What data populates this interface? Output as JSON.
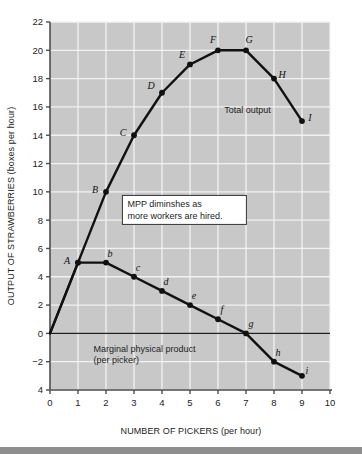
{
  "figure": {
    "background_color": "#ffffff",
    "plot_background_color": "#c8c8c8",
    "gridline_color": "#f2f2f2",
    "axis_color": "#4d4d4d",
    "curve_color": "#111111",
    "bottom_bar_color": "#8e8e8e"
  },
  "chart_data": {
    "type": "line",
    "title": "",
    "xlabel": "NUMBER OF PICKERS (per hour)",
    "ylabel": "OUTPUT OF STRAWBERRIES (boxes per hour)",
    "xlim": [
      0,
      10
    ],
    "ylim": [
      -4,
      22
    ],
    "xticks": [
      "0",
      "1",
      "2",
      "3",
      "4",
      "5",
      "6",
      "7",
      "8",
      "9",
      "10"
    ],
    "xtick_values": [
      0,
      1,
      2,
      3,
      4,
      5,
      6,
      7,
      8,
      9,
      10
    ],
    "yticks": [
      "22",
      "20",
      "18",
      "16",
      "14",
      "12",
      "10",
      "8",
      "6",
      "4",
      "2",
      "0",
      "−2",
      "4"
    ],
    "ytick_values": [
      22,
      20,
      18,
      16,
      14,
      12,
      10,
      8,
      6,
      4,
      2,
      0,
      -2,
      -4
    ],
    "grid": true,
    "legend_position": "inline-labels",
    "series": [
      {
        "name": "Total output",
        "label": "Total output",
        "label_x": 7.05,
        "label_y": 15.6,
        "point_label_case": "uppercase-italic",
        "x": [
          0,
          1,
          2,
          3,
          4,
          5,
          6,
          7,
          8,
          9
        ],
        "y": [
          0,
          5,
          10,
          14,
          17,
          19,
          20,
          20,
          18,
          15
        ],
        "point_labels": [
          "",
          "A",
          "B",
          "C",
          "D",
          "E",
          "F",
          "G",
          "H",
          "I"
        ],
        "label_offsets": [
          [
            0,
            0
          ],
          [
            -11,
            1
          ],
          [
            -11,
            1
          ],
          [
            -11,
            1
          ],
          [
            -11,
            -4
          ],
          [
            -8,
            -6
          ],
          [
            -5,
            -7
          ],
          [
            3,
            -7
          ],
          [
            8,
            -1
          ],
          [
            8,
            0
          ]
        ]
      },
      {
        "name": "Marginal physical product",
        "label": "Marginal physical product\n(per picker)",
        "label_line1": "Marginal physical product",
        "label_line2": "(per picker)",
        "label_x": 1.55,
        "label_y": -1.35,
        "point_label_case": "lowercase-italic",
        "x": [
          0,
          1,
          2,
          3,
          4,
          5,
          6,
          7,
          8,
          9
        ],
        "y": [
          0,
          5,
          5,
          4,
          3,
          2,
          1,
          0,
          -2,
          -3
        ],
        "point_labels": [
          "",
          "A",
          "b",
          "c",
          "d",
          "e",
          "f",
          "g",
          "h",
          "i"
        ],
        "label_offsets": [
          [
            0,
            0
          ],
          [
            -11,
            1
          ],
          [
            4,
            -6
          ],
          [
            4,
            -6
          ],
          [
            4,
            -6
          ],
          [
            4,
            -6
          ],
          [
            4,
            -6
          ],
          [
            5,
            -6
          ],
          [
            4,
            -6
          ],
          [
            5,
            -2
          ]
        ]
      }
    ],
    "annotations": [
      {
        "name": "mpp-annotation",
        "line1": "MPP diminshes as",
        "line2": "more workers are hired.",
        "x": 4.8,
        "y": 8.9,
        "boxed": true,
        "box_fill": "#ffffff",
        "box_border": "#333333"
      }
    ],
    "zero_line": {
      "y": 0,
      "visible": true,
      "color": "#1d1d1d"
    }
  }
}
